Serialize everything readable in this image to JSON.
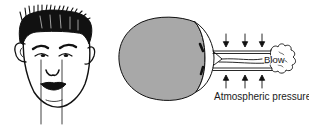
{
  "figure": {
    "left_panel": {
      "subject": "front view of a face with two vertical reference lines through the eyes and mouth corners"
    },
    "right_panel": {
      "subject": "eyeball cross-section with air blown across the front",
      "labels": {
        "blow": "Blow",
        "atmospheric_pressure": "Atmospheric pressure"
      },
      "arrows": {
        "top_count": 3,
        "bottom_count": 3
      }
    },
    "colors": {
      "ink": "#111111",
      "eyeball_fill": "#a8a8a8",
      "background": "#ffffff"
    }
  }
}
